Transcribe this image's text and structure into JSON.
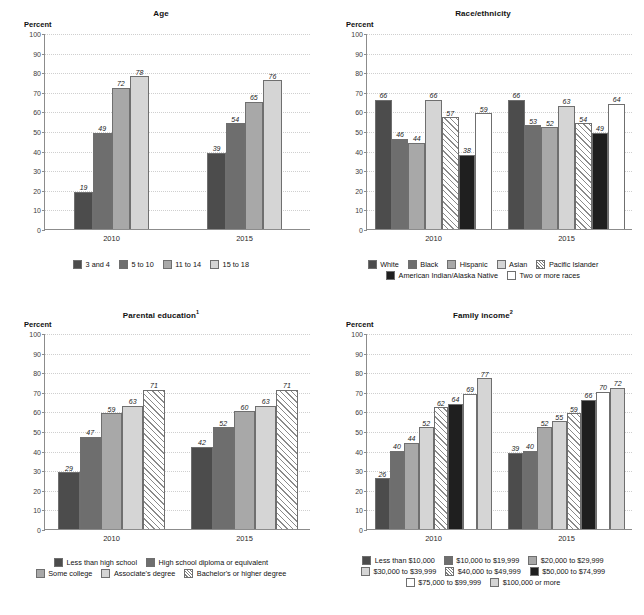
{
  "axis": {
    "y_label": "Percent",
    "ticks": [
      100,
      90,
      80,
      70,
      60,
      50,
      40,
      30,
      20,
      10,
      0
    ],
    "ylim": [
      0,
      100
    ]
  },
  "colors": {
    "c1": "#4c4c4c",
    "c2": "#6e6e6e",
    "c3": "#a8a8a8",
    "c4": "#d5d5d5",
    "c5_hatch": "hatch",
    "c6_black": "#1f1f1f",
    "c7_white": "#ffffff",
    "grid": "#cfcfcf",
    "axis": "#8c8c8c"
  },
  "charts": [
    {
      "id": "age",
      "title": "Age",
      "title_sup": "",
      "chart_data": {
        "type": "bar",
        "title": "Age",
        "xlabel": "",
        "ylabel": "Percent",
        "ylim": [
          0,
          100
        ],
        "grid": true,
        "legend_position": "bottom",
        "categories": [
          "2010",
          "2015"
        ],
        "series": [
          {
            "name": "3 and 4",
            "style": "c1",
            "values": [
              19,
              39
            ]
          },
          {
            "name": "5 to 10",
            "style": "c2",
            "values": [
              49,
              54
            ]
          },
          {
            "name": "11 to 14",
            "style": "c3",
            "values": [
              72,
              65
            ]
          },
          {
            "name": "15 to 18",
            "style": "c4",
            "values": [
              78,
              76
            ]
          }
        ]
      },
      "legend_rows": [
        [
          "3 and 4",
          "5 to 10",
          "11 to 14",
          "15 to 18"
        ]
      ]
    },
    {
      "id": "race-ethnicity",
      "title": "Race/ethnicity",
      "title_sup": "",
      "chart_data": {
        "type": "bar",
        "title": "Race/ethnicity",
        "xlabel": "",
        "ylabel": "Percent",
        "ylim": [
          0,
          100
        ],
        "grid": true,
        "legend_position": "bottom",
        "categories": [
          "2010",
          "2015"
        ],
        "series": [
          {
            "name": "White",
            "style": "c1",
            "values": [
              66,
              66
            ]
          },
          {
            "name": "Black",
            "style": "c2",
            "values": [
              46,
              53
            ]
          },
          {
            "name": "Hispanic",
            "style": "c3",
            "values": [
              44,
              52
            ]
          },
          {
            "name": "Asian",
            "style": "c4",
            "values": [
              66,
              63
            ]
          },
          {
            "name": "Pacific Islander",
            "style": "c5_hatch",
            "values": [
              57,
              54
            ]
          },
          {
            "name": "American Indian/Alaska Native",
            "style": "c6_black",
            "values": [
              38,
              49
            ]
          },
          {
            "name": "Two or more races",
            "style": "c7_white",
            "values": [
              59,
              64
            ]
          }
        ]
      },
      "legend_rows": [
        [
          "White",
          "Black",
          "Hispanic",
          "Asian",
          "Pacific Islander"
        ],
        [
          "American Indian/Alaska Native",
          "Two or more races"
        ]
      ]
    },
    {
      "id": "parental-education",
      "title": "Parental education",
      "title_sup": "1",
      "chart_data": {
        "type": "bar",
        "title": "Parental education",
        "xlabel": "",
        "ylabel": "Percent",
        "ylim": [
          0,
          100
        ],
        "grid": true,
        "legend_position": "bottom",
        "categories": [
          "2010",
          "2015"
        ],
        "series": [
          {
            "name": "Less than high school",
            "style": "c1",
            "values": [
              29,
              42
            ]
          },
          {
            "name": "High school diploma or equivalent",
            "style": "c2",
            "values": [
              47,
              52
            ]
          },
          {
            "name": "Some college",
            "style": "c3",
            "values": [
              59,
              60
            ]
          },
          {
            "name": "Associate's degree",
            "style": "c4",
            "values": [
              63,
              63
            ]
          },
          {
            "name": "Bachelor's or higher degree",
            "style": "c5_hatch",
            "values": [
              71,
              71
            ]
          }
        ]
      },
      "legend_rows": [
        [
          "Less than high school",
          "High school diploma or equivalent"
        ],
        [
          "Some college",
          "Associate's degree",
          "Bachelor's or higher degree"
        ]
      ]
    },
    {
      "id": "family-income",
      "title": "Family income",
      "title_sup": "2",
      "chart_data": {
        "type": "bar",
        "title": "Family income",
        "xlabel": "",
        "ylabel": "Percent",
        "ylim": [
          0,
          100
        ],
        "grid": true,
        "legend_position": "bottom",
        "categories": [
          "2010",
          "2015"
        ],
        "series": [
          {
            "name": "Less than $10,000",
            "style": "c1",
            "values": [
              26,
              39
            ]
          },
          {
            "name": "$10,000 to $19,999",
            "style": "c2",
            "values": [
              40,
              40
            ]
          },
          {
            "name": "$20,000 to $29,999",
            "style": "c3",
            "values": [
              44,
              52
            ]
          },
          {
            "name": "$30,000 to $39,999",
            "style": "c4",
            "values": [
              52,
              55
            ]
          },
          {
            "name": "$40,000 to $49,999",
            "style": "c5_hatch",
            "values": [
              62,
              59
            ]
          },
          {
            "name": "$50,000 to $74,999",
            "style": "c6_black",
            "values": [
              64,
              66
            ]
          },
          {
            "name": "$75,000 to $99,999",
            "style": "c7_white",
            "values": [
              69,
              70
            ]
          },
          {
            "name": "$100,000 or more",
            "style": "c4",
            "values": [
              77,
              72
            ]
          }
        ]
      },
      "legend_rows": [
        [
          "Less than $10,000",
          "$10,000 to $19,999",
          "$20,000 to $29,999"
        ],
        [
          "$30,000 to $39,999",
          "$40,000 to $49,999",
          "$50,000 to $74,999"
        ],
        [
          "$75,000 to $99,999",
          "$100,000 or more"
        ]
      ]
    }
  ]
}
